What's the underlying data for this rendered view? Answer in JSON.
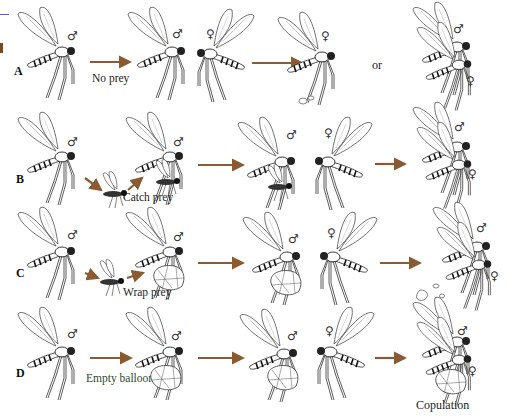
{
  "figure": {
    "rows": [
      {
        "label": "A",
        "captions": [
          {
            "text": "No prey",
            "color": "#333333"
          }
        ],
        "connector": "or"
      },
      {
        "label": "B",
        "captions": [
          {
            "text": "Catch prey",
            "color": "#333333"
          }
        ]
      },
      {
        "label": "C",
        "captions": [
          {
            "text": "Wrap prey",
            "color": "#333333"
          }
        ]
      },
      {
        "label": "D",
        "captions": [
          {
            "text": "Empty balloon",
            "color": "#2f4a2c"
          },
          {
            "text": "Copulation",
            "color": "#333333"
          }
        ]
      }
    ],
    "symbols": {
      "male": "♂",
      "female": "♀"
    },
    "colors": {
      "arrow": "#8a5a32",
      "ink": "#1a1a1a",
      "edge_line": "#5a5ad0",
      "background": "#ffffff"
    }
  }
}
